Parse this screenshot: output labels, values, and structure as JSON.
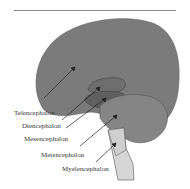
{
  "figure": {
    "type": "brain-region-diagram",
    "labels": [
      {
        "id": "telencephalon",
        "text": "Telencephalon"
      },
      {
        "id": "diencephalon",
        "text": "Diencephalon"
      },
      {
        "id": "mesencephalon",
        "text": "Mesencephalon"
      },
      {
        "id": "metencephalon",
        "text": "Metencephalon"
      },
      {
        "id": "myelencephalon",
        "text": "Myelencephalon"
      }
    ],
    "colors": {
      "telencephalon": "#7b7b7b",
      "diencephalon": "#6a6a6a",
      "mesencephalon": "#8d8d8d",
      "metencephalon": "#858585",
      "myelencephalon": "#d6d6d6",
      "outline": "#555555",
      "rule": "#8a8a8a"
    }
  }
}
